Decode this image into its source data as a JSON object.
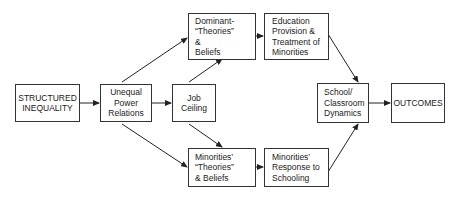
{
  "diagram": {
    "nodes": {
      "structured_inequality": {
        "lines": [
          "STRUCTURED",
          "INEQUALITY"
        ]
      },
      "unequal_power": {
        "lines": [
          "Unequal",
          "Power",
          "Relations"
        ]
      },
      "job_ceiling": {
        "lines": [
          "Job",
          "Ceiling"
        ]
      },
      "dominant_theories": {
        "lines": [
          "Dominant-",
          "“Theories”",
          "&",
          "Beliefs"
        ]
      },
      "minorities_theories": {
        "lines": [
          "Minorities’",
          "“Theories”",
          "& Beliefs"
        ]
      },
      "education_provision": {
        "lines": [
          "Education",
          "Provision &",
          "Treatment of",
          "Minorities"
        ]
      },
      "minorities_response": {
        "lines": [
          "Minorities’",
          "Response to",
          "Schooling"
        ]
      },
      "school_dynamics": {
        "lines": [
          "School/",
          "Classroom",
          "Dynamics"
        ]
      },
      "outcomes": {
        "lines": [
          "OUTCOMES"
        ]
      }
    },
    "edges": [
      [
        "structured_inequality",
        "unequal_power"
      ],
      [
        "unequal_power",
        "job_ceiling"
      ],
      [
        "unequal_power",
        "dominant_theories"
      ],
      [
        "unequal_power",
        "minorities_theories"
      ],
      [
        "job_ceiling",
        "dominant_theories"
      ],
      [
        "job_ceiling",
        "minorities_theories"
      ],
      [
        "dominant_theories",
        "education_provision"
      ],
      [
        "minorities_theories",
        "minorities_response"
      ],
      [
        "education_provision",
        "school_dynamics"
      ],
      [
        "minorities_response",
        "school_dynamics"
      ],
      [
        "school_dynamics",
        "outcomes"
      ]
    ]
  }
}
